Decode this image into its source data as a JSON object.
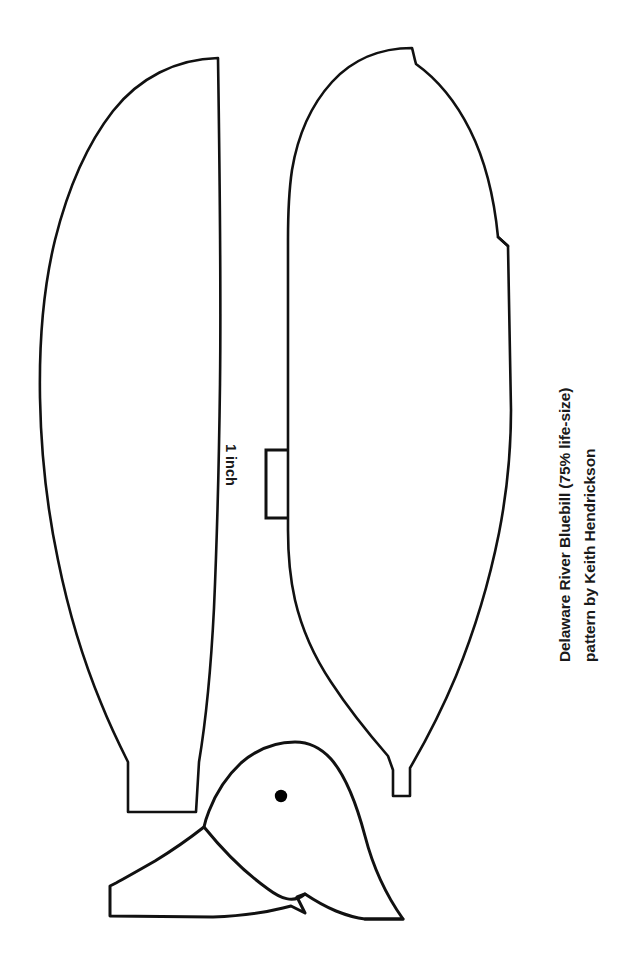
{
  "sheet": {
    "width": 636,
    "height": 965,
    "background": "#ffffff",
    "ink": "#111111",
    "title": "Delaware River Bluebill decoy pattern sheet"
  },
  "credit": {
    "line1": "Delaware River Bluebill (75% life-size)",
    "line2": "pattern by Keith Hendrickson",
    "orientation": "rotated-90-ccw",
    "color": "#1a1a1a"
  },
  "scale": {
    "label": "1 inch",
    "orientation": "rotated-90-cw",
    "bracket": {
      "top_y": 450,
      "bottom_y": 518,
      "spine_x": 266,
      "arm_length": 21,
      "stroke_color": "#111111",
      "stroke_width": 3
    }
  },
  "pieces": [
    {
      "name": "body-profile-left",
      "label": "left body profile blank",
      "bbox": [
        40,
        56,
        222,
        815
      ],
      "stroke": "#111111",
      "stroke_width": 2.6,
      "fill": "none"
    },
    {
      "name": "body-profile-right",
      "label": "right body profile blank",
      "bbox": [
        288,
        46,
        512,
        800
      ],
      "stroke": "#111111",
      "stroke_width": 2.6,
      "fill": "none"
    },
    {
      "name": "head-and-bill",
      "label": "head and bill blank",
      "bbox": [
        108,
        740,
        406,
        922
      ],
      "stroke": "#111111",
      "stroke_width": 3.0,
      "fill": "none"
    }
  ],
  "eye": {
    "name": "eye-marker",
    "cx": 281,
    "cy": 796,
    "r": 6.2,
    "color": "#000000"
  }
}
